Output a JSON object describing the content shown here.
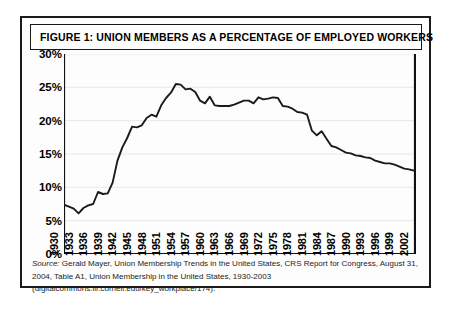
{
  "figure": {
    "title": "FIGURE 1: UNION MEMBERS AS A PERCENTAGE OF EMPLOYED WORKERS",
    "source_lead": "Source:",
    "source_text": " Gerald Mayer, Union Membership Trends in the United States, CRS Report for Congress, August 31, 2004, Table A1, Union Membership in the United States, 1930-2003 (digitalcommons.ilr.cornell.edu/key_workplace/174)."
  },
  "chart_data": {
    "type": "line",
    "title": "FIGURE 1: UNION MEMBERS AS A PERCENTAGE OF EMPLOYED WORKERS",
    "xlabel": "",
    "ylabel": "",
    "ylim": [
      0,
      30
    ],
    "xlim": [
      1930,
      2002
    ],
    "grid": true,
    "legend": "none",
    "line_color": "#1a1a1a",
    "ytick_labels": [
      "30%",
      "25%",
      "20%",
      "15%",
      "10%",
      "5%",
      "0%"
    ],
    "ytick_values": [
      30,
      25,
      20,
      15,
      10,
      5,
      0
    ],
    "xtick_labels": [
      "1930",
      "1933",
      "1936",
      "1939",
      "1942",
      "1945",
      "1948",
      "1951",
      "1954",
      "1957",
      "1960",
      "1963",
      "1966",
      "1969",
      "1972",
      "1975",
      "1978",
      "1981",
      "1984",
      "1987",
      "1990",
      "1993",
      "1996",
      "1999",
      "2002"
    ],
    "xtick_values": [
      1930,
      1933,
      1936,
      1939,
      1942,
      1945,
      1948,
      1951,
      1954,
      1957,
      1960,
      1963,
      1966,
      1969,
      1972,
      1975,
      1978,
      1981,
      1984,
      1987,
      1990,
      1993,
      1996,
      1999,
      2002
    ],
    "x": [
      1930,
      1931,
      1932,
      1933,
      1934,
      1935,
      1936,
      1937,
      1938,
      1939,
      1940,
      1941,
      1942,
      1943,
      1944,
      1945,
      1946,
      1947,
      1948,
      1949,
      1950,
      1951,
      1952,
      1953,
      1954,
      1955,
      1956,
      1957,
      1958,
      1959,
      1960,
      1961,
      1962,
      1963,
      1964,
      1965,
      1966,
      1967,
      1968,
      1969,
      1970,
      1971,
      1972,
      1973,
      1974,
      1975,
      1976,
      1977,
      1978,
      1979,
      1980,
      1981,
      1982,
      1983,
      1984,
      1985,
      1986,
      1987,
      1988,
      1989,
      1990,
      1991,
      1992,
      1993,
      1994,
      1995,
      1996,
      1997,
      1998,
      1999,
      2000,
      2001,
      2002
    ],
    "values": [
      7.4,
      7.1,
      6.8,
      6.1,
      6.9,
      7.3,
      7.5,
      9.3,
      9.0,
      9.1,
      10.7,
      14.0,
      16.0,
      17.4,
      19.1,
      19.0,
      19.3,
      20.4,
      20.9,
      20.6,
      22.3,
      23.4,
      24.2,
      25.5,
      25.4,
      24.7,
      24.8,
      24.3,
      23.0,
      22.6,
      23.6,
      22.3,
      22.2,
      22.2,
      22.2,
      22.4,
      22.7,
      23.0,
      23.0,
      22.6,
      23.5,
      23.2,
      23.3,
      23.5,
      23.4,
      22.2,
      22.1,
      21.8,
      21.3,
      21.2,
      20.9,
      18.5,
      17.8,
      18.4,
      17.3,
      16.2,
      16.0,
      15.6,
      15.2,
      15.1,
      14.8,
      14.7,
      14.5,
      14.4,
      14.0,
      13.8,
      13.6,
      13.6,
      13.4,
      13.1,
      12.8,
      12.7,
      12.5
    ]
  }
}
